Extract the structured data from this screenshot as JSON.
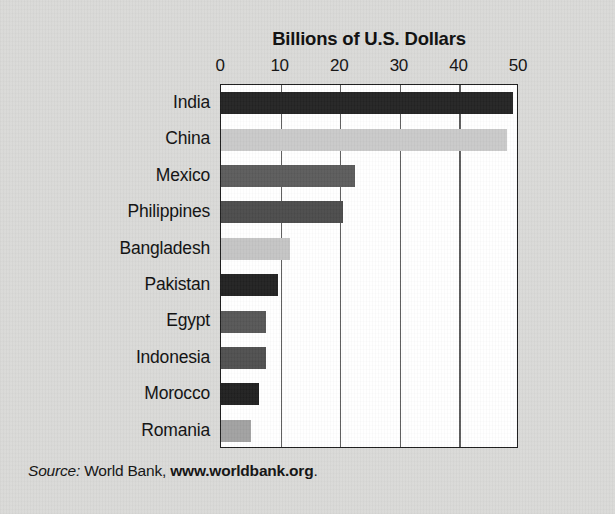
{
  "figure": {
    "background_color": "#d9d9d7",
    "plot_background": "#ffffff",
    "border_color": "#1a1a1a"
  },
  "source": {
    "prefix": "Source:",
    "publisher": "World Bank,",
    "url": "www.worldbank.org",
    "suffix": "."
  },
  "chart_data": {
    "type": "bar",
    "orientation": "horizontal",
    "title": "Billions of U.S. Dollars",
    "xlabel": "",
    "ylabel": "",
    "xlim": [
      0,
      50
    ],
    "grid": true,
    "legend": "none",
    "tick_labels": [
      "0",
      "10",
      "20",
      "30",
      "40",
      "50"
    ],
    "ticks": [
      0,
      10,
      20,
      30,
      40,
      50
    ],
    "categories": [
      "India",
      "China",
      "Mexico",
      "Philippines",
      "Bangladesh",
      "Pakistan",
      "Egypt",
      "Indonesia",
      "Morocco",
      "Romania"
    ],
    "values": [
      49,
      48,
      22.5,
      20.5,
      11.5,
      9.5,
      7.5,
      7.5,
      6.3,
      5
    ],
    "bar_colors": [
      "#232323",
      "#c9c9c9",
      "#5b5b5b",
      "#4b4b4b",
      "#c4c4c4",
      "#212121",
      "#565656",
      "#4f4f4f",
      "#1f1f1f",
      "#a1a1a1"
    ]
  }
}
